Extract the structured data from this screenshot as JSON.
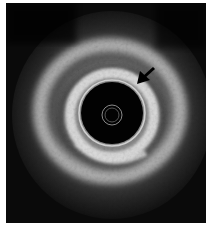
{
  "image": {
    "kind": "intravascular-ultrasound-cross-section",
    "description": "Grayscale circular cross-sectional vessel scan with dark lumen, central catheter ring, bright concentric wall layers and a black arrow pointing at the wall",
    "annotation": {
      "type": "arrow",
      "direction": "down-left",
      "color": "#000000"
    },
    "colors": {
      "background": "#0a0a0a",
      "border": "#ffffff",
      "bright_tissue": "#d8d8d8",
      "lumen": "#020202"
    }
  }
}
